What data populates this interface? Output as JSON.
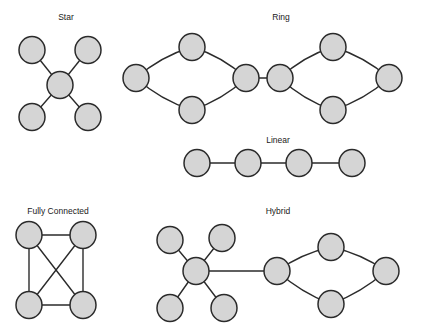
{
  "canvas": {
    "width": 424,
    "height": 334,
    "background": "#ffffff"
  },
  "style": {
    "node_fill": "#d5d5d5",
    "node_stroke": "#2b2b2b",
    "node_stroke_width": 1.5,
    "edge_stroke": "#2b2b2b",
    "edge_stroke_width": 1.4,
    "label_color": "#1a1a1a",
    "label_font_size": 8.5,
    "node_rx": 13,
    "node_ry": 13.5
  },
  "diagrams": [
    {
      "id": "star",
      "label": "Star",
      "label_pos": {
        "x": 66,
        "y": 20
      },
      "nodes": [
        {
          "id": "s-tl",
          "name": "star-node-top-left",
          "x": 32,
          "y": 50,
          "rx": 13,
          "ry": 13.5
        },
        {
          "id": "s-tr",
          "name": "star-node-top-right",
          "x": 88,
          "y": 50,
          "rx": 13,
          "ry": 13.5
        },
        {
          "id": "s-hub",
          "name": "star-node-hub",
          "x": 60,
          "y": 85,
          "rx": 13,
          "ry": 13.5
        },
        {
          "id": "s-bl",
          "name": "star-node-bottom-left",
          "x": 32,
          "y": 117,
          "rx": 13,
          "ry": 13.5
        },
        {
          "id": "s-br",
          "name": "star-node-bottom-right",
          "x": 88,
          "y": 117,
          "rx": 13,
          "ry": 13.5
        }
      ],
      "edges": [
        {
          "name": "star-edge-hub-top-left",
          "type": "line",
          "from": "s-hub",
          "to": "s-tl"
        },
        {
          "name": "star-edge-hub-top-right",
          "type": "line",
          "from": "s-hub",
          "to": "s-tr"
        },
        {
          "name": "star-edge-hub-bottom-left",
          "type": "line",
          "from": "s-hub",
          "to": "s-bl"
        },
        {
          "name": "star-edge-hub-bottom-right",
          "type": "line",
          "from": "s-hub",
          "to": "s-br"
        }
      ]
    },
    {
      "id": "ring",
      "label": "Ring",
      "label_pos": {
        "x": 281,
        "y": 20
      },
      "nodes": [
        {
          "id": "r1-left",
          "name": "ring-left-node-west",
          "x": 136,
          "y": 78,
          "rx": 13,
          "ry": 13.5
        },
        {
          "id": "r1-top",
          "name": "ring-left-node-north",
          "x": 192,
          "y": 47,
          "rx": 13,
          "ry": 13.5
        },
        {
          "id": "r1-bottom",
          "name": "ring-left-node-south",
          "x": 192,
          "y": 110,
          "rx": 13,
          "ry": 13.5
        },
        {
          "id": "r1-right",
          "name": "ring-left-node-east",
          "x": 246,
          "y": 78,
          "rx": 13,
          "ry": 13.5
        },
        {
          "id": "r2-left",
          "name": "ring-right-node-west",
          "x": 280,
          "y": 78,
          "rx": 13,
          "ry": 13.5
        },
        {
          "id": "r2-top",
          "name": "ring-right-node-north",
          "x": 333,
          "y": 47,
          "rx": 13,
          "ry": 13.5
        },
        {
          "id": "r2-bottom",
          "name": "ring-right-node-south",
          "x": 333,
          "y": 110,
          "rx": 13,
          "ry": 13.5
        },
        {
          "id": "r2-right",
          "name": "ring-right-node-east",
          "x": 389,
          "y": 78,
          "rx": 13,
          "ry": 13.5
        }
      ],
      "edges": [
        {
          "name": "ring-left-arc-northwest",
          "type": "curve",
          "from": "r1-left",
          "to": "r1-top",
          "bow": -7
        },
        {
          "name": "ring-left-arc-northeast",
          "type": "curve",
          "from": "r1-top",
          "to": "r1-right",
          "bow": -7
        },
        {
          "name": "ring-left-arc-southwest",
          "type": "curve",
          "from": "r1-left",
          "to": "r1-bottom",
          "bow": 7
        },
        {
          "name": "ring-left-arc-southeast",
          "type": "curve",
          "from": "r1-bottom",
          "to": "r1-right",
          "bow": 7
        },
        {
          "name": "ring-bridge-edge",
          "type": "line",
          "from": "r1-right",
          "to": "r2-left"
        },
        {
          "name": "ring-right-arc-northwest",
          "type": "curve",
          "from": "r2-left",
          "to": "r2-top",
          "bow": -7
        },
        {
          "name": "ring-right-arc-northeast",
          "type": "curve",
          "from": "r2-top",
          "to": "r2-right",
          "bow": -7
        },
        {
          "name": "ring-right-arc-southwest",
          "type": "curve",
          "from": "r2-left",
          "to": "r2-bottom",
          "bow": 7
        },
        {
          "name": "ring-right-arc-southeast",
          "type": "curve",
          "from": "r2-bottom",
          "to": "r2-right",
          "bow": 7
        }
      ]
    },
    {
      "id": "linear",
      "label": "Linear",
      "label_pos": {
        "x": 278,
        "y": 143
      },
      "nodes": [
        {
          "id": "l1",
          "name": "linear-node-1",
          "x": 197,
          "y": 163,
          "rx": 13,
          "ry": 13.5
        },
        {
          "id": "l2",
          "name": "linear-node-2",
          "x": 248,
          "y": 163,
          "rx": 13,
          "ry": 13.5
        },
        {
          "id": "l3",
          "name": "linear-node-3",
          "x": 299,
          "y": 163,
          "rx": 13,
          "ry": 13.5
        },
        {
          "id": "l4",
          "name": "linear-node-4",
          "x": 352,
          "y": 163,
          "rx": 13,
          "ry": 13.5
        }
      ],
      "edges": [
        {
          "name": "linear-edge-1-2",
          "type": "line",
          "from": "l1",
          "to": "l2"
        },
        {
          "name": "linear-edge-2-3",
          "type": "line",
          "from": "l2",
          "to": "l3"
        },
        {
          "name": "linear-edge-3-4",
          "type": "line",
          "from": "l3",
          "to": "l4"
        }
      ]
    },
    {
      "id": "fully-connected",
      "label": "Fully Connected",
      "label_pos": {
        "x": 58,
        "y": 214
      },
      "nodes": [
        {
          "id": "f-tl",
          "name": "fully-connected-node-top-left",
          "x": 29,
          "y": 235,
          "rx": 13,
          "ry": 13.5
        },
        {
          "id": "f-tr",
          "name": "fully-connected-node-top-right",
          "x": 83,
          "y": 235,
          "rx": 13,
          "ry": 13.5
        },
        {
          "id": "f-bl",
          "name": "fully-connected-node-bottom-left",
          "x": 29,
          "y": 305,
          "rx": 13,
          "ry": 13.5
        },
        {
          "id": "f-br",
          "name": "fully-connected-node-bottom-right",
          "x": 83,
          "y": 305,
          "rx": 13,
          "ry": 13.5
        }
      ],
      "edges": [
        {
          "name": "fully-connected-edge-top",
          "type": "line",
          "from": "f-tl",
          "to": "f-tr"
        },
        {
          "name": "fully-connected-edge-left",
          "type": "line",
          "from": "f-tl",
          "to": "f-bl"
        },
        {
          "name": "fully-connected-edge-right",
          "type": "line",
          "from": "f-tr",
          "to": "f-br"
        },
        {
          "name": "fully-connected-edge-bottom",
          "type": "line",
          "from": "f-bl",
          "to": "f-br"
        },
        {
          "name": "fully-connected-edge-diagonal-1",
          "type": "line",
          "from": "f-tl",
          "to": "f-br"
        },
        {
          "name": "fully-connected-edge-diagonal-2",
          "type": "line",
          "from": "f-tr",
          "to": "f-bl"
        }
      ]
    },
    {
      "id": "hybrid",
      "label": "Hybrid",
      "label_pos": {
        "x": 278,
        "y": 214
      },
      "nodes": [
        {
          "id": "h-tl",
          "name": "hybrid-star-node-top-left",
          "x": 170,
          "y": 240,
          "rx": 13,
          "ry": 13.5
        },
        {
          "id": "h-tr",
          "name": "hybrid-star-node-top-right",
          "x": 222,
          "y": 238,
          "rx": 13,
          "ry": 13.5
        },
        {
          "id": "h-hub",
          "name": "hybrid-star-node-hub",
          "x": 196,
          "y": 271,
          "rx": 13,
          "ry": 13.5
        },
        {
          "id": "h-bl",
          "name": "hybrid-star-node-bottom-left",
          "x": 170,
          "y": 308,
          "rx": 13,
          "ry": 13.5
        },
        {
          "id": "h-br",
          "name": "hybrid-star-node-bottom-right",
          "x": 224,
          "y": 308,
          "rx": 13,
          "ry": 13.5
        },
        {
          "id": "h-ring-w",
          "name": "hybrid-ring-node-west",
          "x": 277,
          "y": 271,
          "rx": 13,
          "ry": 13.5
        },
        {
          "id": "h-ring-n",
          "name": "hybrid-ring-node-north",
          "x": 331,
          "y": 247,
          "rx": 13,
          "ry": 13.5
        },
        {
          "id": "h-ring-s",
          "name": "hybrid-ring-node-south",
          "x": 331,
          "y": 304,
          "rx": 13,
          "ry": 13.5
        },
        {
          "id": "h-ring-e",
          "name": "hybrid-ring-node-east",
          "x": 386,
          "y": 271,
          "rx": 13,
          "ry": 13.5
        }
      ],
      "edges": [
        {
          "name": "hybrid-star-edge-top-left",
          "type": "line",
          "from": "h-hub",
          "to": "h-tl"
        },
        {
          "name": "hybrid-star-edge-top-right",
          "type": "line",
          "from": "h-hub",
          "to": "h-tr"
        },
        {
          "name": "hybrid-star-edge-bottom-left",
          "type": "line",
          "from": "h-hub",
          "to": "h-bl"
        },
        {
          "name": "hybrid-star-edge-bottom-right",
          "type": "line",
          "from": "h-hub",
          "to": "h-br"
        },
        {
          "name": "hybrid-bridge-edge",
          "type": "line",
          "from": "h-hub",
          "to": "h-ring-w"
        },
        {
          "name": "hybrid-ring-arc-northwest",
          "type": "curve",
          "from": "h-ring-w",
          "to": "h-ring-n",
          "bow": -6
        },
        {
          "name": "hybrid-ring-arc-northeast",
          "type": "curve",
          "from": "h-ring-n",
          "to": "h-ring-e",
          "bow": -6
        },
        {
          "name": "hybrid-ring-arc-southwest",
          "type": "curve",
          "from": "h-ring-w",
          "to": "h-ring-s",
          "bow": 6
        },
        {
          "name": "hybrid-ring-arc-southeast",
          "type": "curve",
          "from": "h-ring-s",
          "to": "h-ring-e",
          "bow": 6
        }
      ]
    }
  ]
}
